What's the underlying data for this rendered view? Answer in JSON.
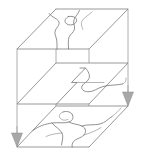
{
  "figure": {
    "title": "Stacked Isometric Slice Block Diagram",
    "type": "3d-block-diagram",
    "background_color": "#ffffff",
    "line_color": "#6e6e6e",
    "edge_color": "#9a9a9a",
    "arrow_color": "#a8a8a8",
    "width": 144,
    "height": 157
  },
  "slices": [
    {
      "id": "top-slice",
      "name": "Top slice",
      "label": "",
      "order": 1,
      "outline_points": "17,49 56,9 128,9 89,49",
      "contour_count": 3,
      "description": "Upper parallelogram plane with a closed blob contour and two sinuous contour lines"
    },
    {
      "id": "middle-slice",
      "name": "Middle slice",
      "label": "",
      "order": 2,
      "outline_points": "17,104 56,63 128,63 89,104",
      "contour_count": 1,
      "description": "Middle parallelogram plane with a single stepped zig-zag boundary contour"
    },
    {
      "id": "bottom-slice",
      "name": "Bottom slice",
      "label": "",
      "order": 3,
      "outline_points": "17,147 56,106 128,106 89,147",
      "contour_count": 4,
      "description": "Lower parallelogram plane with a dense network of branching contour lines"
    }
  ],
  "vertical_edges": [
    {
      "id": "edge-front-left",
      "name": "front-left-edge",
      "x1": 17,
      "y1": 49,
      "x2": 17,
      "y2": 147
    },
    {
      "id": "edge-back-left",
      "name": "back-left-edge",
      "x1": 56,
      "y1": 9,
      "x2": 56,
      "y2": 106
    },
    {
      "id": "edge-back-right",
      "name": "back-right-edge",
      "x1": 128,
      "y1": 9,
      "x2": 128,
      "y2": 106
    },
    {
      "id": "edge-front-right",
      "name": "front-right-edge",
      "x1": 89,
      "y1": 49,
      "x2": 89,
      "y2": 147
    }
  ],
  "arrows": [
    {
      "id": "arrow-left",
      "name": "down-arrow-left",
      "direction": "down",
      "x": 17,
      "y_tip": 147,
      "label": ""
    },
    {
      "id": "arrow-right",
      "name": "down-arrow-right",
      "direction": "down",
      "x": 128,
      "y_tip": 106,
      "label": ""
    }
  ],
  "annotations": []
}
